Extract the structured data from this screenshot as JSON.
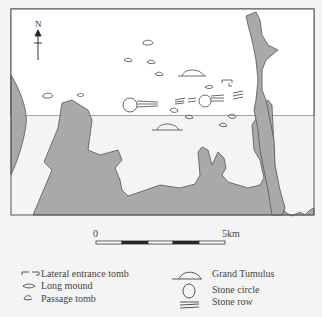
{
  "map": {
    "north_label": "N",
    "land_color": "#ffffff",
    "water_color": "#a9a9a9",
    "border_color": "#555555"
  },
  "scale_bar": {
    "start_label": "0",
    "end_label": "5km"
  },
  "legend": {
    "items": [
      {
        "icon": "lateral-entrance-tomb-icon",
        "label": "Lateral entrance tomb"
      },
      {
        "icon": "long-mound-icon",
        "label": "Long mound"
      },
      {
        "icon": "passage-tomb-icon",
        "label": "Passage tomb"
      },
      {
        "icon": "grand-tumulus-icon",
        "label": "Grand Tumulus"
      },
      {
        "icon": "stone-circle-icon",
        "label": "Stone circle"
      },
      {
        "icon": "stone-row-icon",
        "label": "Stone row"
      }
    ]
  }
}
